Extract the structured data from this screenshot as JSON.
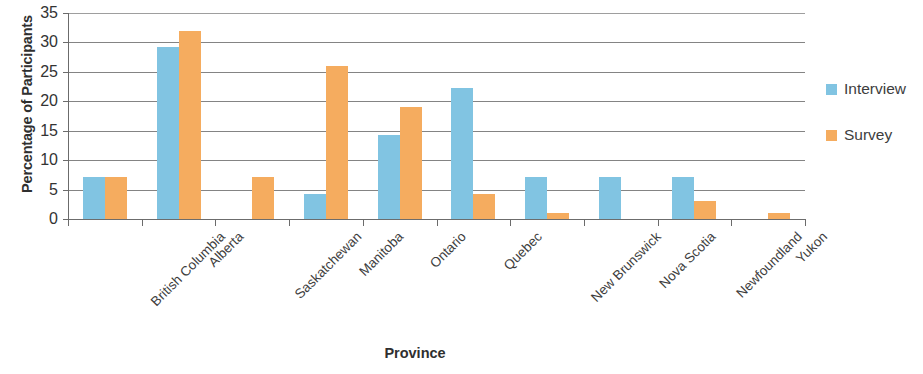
{
  "chart_data": {
    "type": "bar",
    "title": "",
    "xlabel": "Province",
    "ylabel": "Percentage of Participants",
    "ylim": [
      0,
      35
    ],
    "ytick_labels": [
      "0",
      "5",
      "10",
      "15",
      "20",
      "25",
      "30",
      "35"
    ],
    "ytick_values": [
      0,
      5,
      10,
      15,
      20,
      25,
      30,
      35
    ],
    "grid": true,
    "legend_position": "right",
    "categories": [
      "British Columbia",
      "Alberta",
      "Saskatchewan",
      "Manitoba",
      "Ontario",
      "Quebec",
      "New Brunswick",
      "Nova Scotia",
      "Newfoundland",
      "Yukon"
    ],
    "series": [
      {
        "name": "Interview",
        "color": "#81C4E2",
        "values": [
          7.2,
          29.2,
          0,
          4.2,
          14.3,
          22.2,
          7.2,
          7.2,
          7.2,
          0
        ]
      },
      {
        "name": "Survey",
        "color": "#F5AC5F",
        "values": [
          7.2,
          32.0,
          7.2,
          26.0,
          19.0,
          4.2,
          1.0,
          0,
          3.0,
          1.0
        ]
      }
    ]
  },
  "legend": {
    "items": [
      {
        "label": "Interview",
        "color": "#81C4E2"
      },
      {
        "label": "Survey",
        "color": "#F5AC5F"
      }
    ]
  },
  "axes": {
    "y_title": "Percentage of Participants",
    "x_title": "Province"
  }
}
